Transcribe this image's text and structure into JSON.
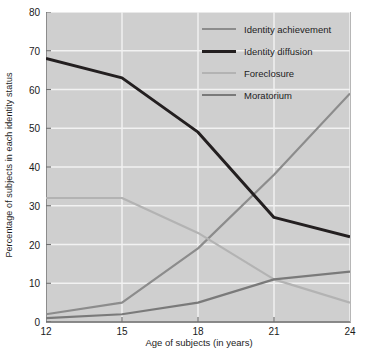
{
  "chart_data": {
    "type": "line",
    "title": "",
    "xlabel": "Age of subjects (in years)",
    "ylabel": "Percentage of subjects in each identity status",
    "x": [
      12,
      15,
      18,
      21,
      24
    ],
    "xlim": [
      12,
      24
    ],
    "ylim": [
      0,
      80
    ],
    "xticks": [
      "12",
      "15",
      "18",
      "21",
      "24"
    ],
    "yticks": [
      "0",
      "10",
      "20",
      "30",
      "40",
      "50",
      "60",
      "70",
      "80"
    ],
    "grid": "horizontal-and-vertical-white",
    "legend_position": "top-right-inside",
    "series": [
      {
        "name": "Identity achievement",
        "color": "#8c8c8c",
        "width": 2.2,
        "values": [
          2,
          5,
          19,
          38,
          59
        ]
      },
      {
        "name": "Identity diffusion",
        "color": "#231f20",
        "width": 3.0,
        "values": [
          68,
          63,
          49,
          27,
          22
        ]
      },
      {
        "name": "Foreclosure",
        "color": "#b3b3b3",
        "width": 2.2,
        "values": [
          32,
          32,
          23,
          11,
          5
        ]
      },
      {
        "name": "Moratorium",
        "color": "#7a7a7a",
        "width": 2.2,
        "values": [
          1,
          2,
          5,
          11,
          13
        ]
      }
    ]
  },
  "plot": {
    "background": "#cfcfcf",
    "gridline_color": "#f2f2f2",
    "axis_color": "#6f6f6f"
  }
}
